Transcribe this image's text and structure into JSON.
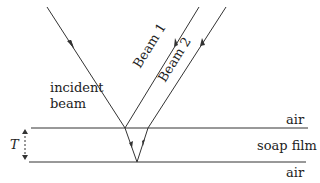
{
  "diagram": {
    "labels": {
      "incident": [
        "incident",
        "beam"
      ],
      "beam1": "Beam 1",
      "beam2": "Beam 2",
      "air_top": "air",
      "film": "soap film",
      "air_bottom": "air",
      "thickness": "T"
    },
    "colors": {
      "line": "#333333",
      "text": "#222222",
      "background": "#ffffff"
    }
  }
}
